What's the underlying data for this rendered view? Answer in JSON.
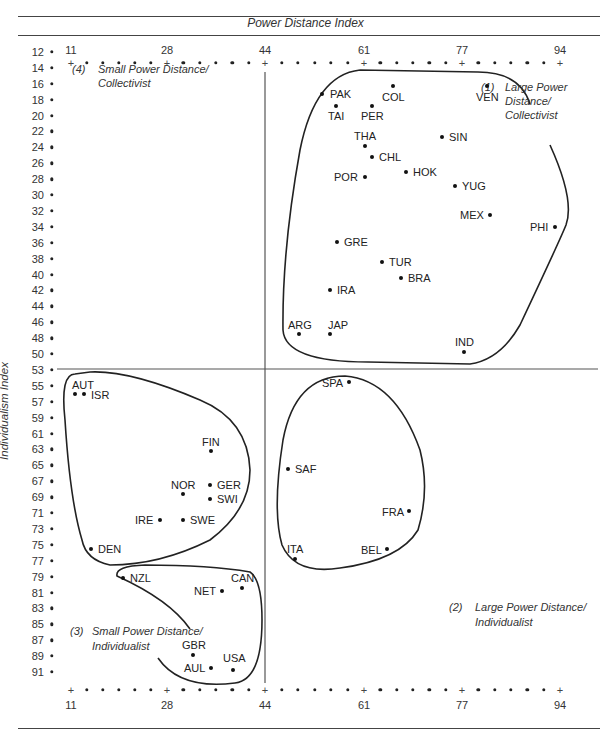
{
  "header": {
    "title": "Power Distance Index"
  },
  "y_axis_label": "Individualism Index",
  "x_ticks": [
    "11",
    "28",
    "44",
    "61",
    "77",
    "94"
  ],
  "y_ticks": [
    "12",
    "14",
    "16",
    "18",
    "20",
    "22",
    "24",
    "26",
    "28",
    "30",
    "32",
    "34",
    "36",
    "38",
    "40",
    "42",
    "44",
    "46",
    "48",
    "50",
    "53",
    "55",
    "57",
    "59",
    "61",
    "63",
    "65",
    "67",
    "69",
    "71",
    "73",
    "75",
    "77",
    "79",
    "81",
    "83",
    "85",
    "87",
    "89",
    "91"
  ],
  "quadrants": {
    "q1": {
      "num": "(1)",
      "line1": "Large Power",
      "line2": "Distance/",
      "line3": "Collectivist"
    },
    "q2": {
      "num": "(2)",
      "line1": "Large Power Distance/",
      "line2": "Individualist"
    },
    "q3": {
      "num": "(3)",
      "line1": "Small Power Distance/",
      "line2": "Individualist"
    },
    "q4": {
      "num": "(4)",
      "line1": "Small Power Distance/",
      "line2": "Collectivist"
    }
  },
  "countries": {
    "PAK": "PAK",
    "COL": "COL",
    "VEN": "VEN",
    "TAI": "TAI",
    "PER": "PER",
    "THA": "THA",
    "SIN": "SIN",
    "CHL": "CHL",
    "HOK": "HOK",
    "POR": "POR",
    "YUG": "YUG",
    "MEX": "MEX",
    "PHI": "PHI",
    "GRE": "GRE",
    "TUR": "TUR",
    "BRA": "BRA",
    "IRA": "IRA",
    "ARG": "ARG",
    "JAP": "JAP",
    "IND": "IND",
    "AUT": "AUT",
    "ISR": "ISR",
    "FIN": "FIN",
    "NOR": "NOR",
    "GER": "GER",
    "SWI": "SWI",
    "IRE": "IRE",
    "SWE": "SWE",
    "DEN": "DEN",
    "SPA": "SPA",
    "SAF": "SAF",
    "FRA": "FRA",
    "ITA": "ITA",
    "BEL": "BEL",
    "NZL": "NZL",
    "CAN": "CAN",
    "NET": "NET",
    "GBR": "GBR",
    "AUL": "AUL",
    "USA": "USA"
  },
  "chart_data": {
    "type": "scatter",
    "title": "Power Distance Index",
    "xlabel": "Power Distance Index",
    "ylabel": "Individualism Index",
    "x_ticks": [
      11,
      28,
      44,
      61,
      77,
      94
    ],
    "y_ticks": [
      12,
      14,
      16,
      18,
      20,
      22,
      24,
      26,
      28,
      30,
      32,
      34,
      36,
      38,
      40,
      42,
      44,
      46,
      48,
      50,
      53,
      55,
      57,
      59,
      61,
      63,
      65,
      67,
      69,
      71,
      73,
      75,
      77,
      79,
      81,
      83,
      85,
      87,
      89,
      91
    ],
    "xlim": [
      11,
      94
    ],
    "ylim_top_to_bottom": [
      12,
      91
    ],
    "quadrant_dividers": {
      "x": 44,
      "y": 50
    },
    "grid": false,
    "points": [
      {
        "label": "PAK",
        "x": 55,
        "y": 14
      },
      {
        "label": "COL",
        "x": 67,
        "y": 13
      },
      {
        "label": "VEN",
        "x": 81,
        "y": 12
      },
      {
        "label": "TAI",
        "x": 58,
        "y": 17
      },
      {
        "label": "PER",
        "x": 64,
        "y": 16
      },
      {
        "label": "THA",
        "x": 64,
        "y": 20
      },
      {
        "label": "SIN",
        "x": 74,
        "y": 20
      },
      {
        "label": "CHL",
        "x": 63,
        "y": 23
      },
      {
        "label": "HOK",
        "x": 68,
        "y": 25
      },
      {
        "label": "POR",
        "x": 63,
        "y": 27
      },
      {
        "label": "YUG",
        "x": 76,
        "y": 27
      },
      {
        "label": "MEX",
        "x": 81,
        "y": 30
      },
      {
        "label": "PHI",
        "x": 94,
        "y": 32
      },
      {
        "label": "GRE",
        "x": 60,
        "y": 35
      },
      {
        "label": "TUR",
        "x": 66,
        "y": 37
      },
      {
        "label": "BRA",
        "x": 69,
        "y": 38
      },
      {
        "label": "IRA",
        "x": 58,
        "y": 41
      },
      {
        "label": "ARG",
        "x": 49,
        "y": 46
      },
      {
        "label": "JAP",
        "x": 54,
        "y": 46
      },
      {
        "label": "IND",
        "x": 77,
        "y": 48
      },
      {
        "label": "AUT",
        "x": 11,
        "y": 55
      },
      {
        "label": "ISR",
        "x": 13,
        "y": 54
      },
      {
        "label": "FIN",
        "x": 33,
        "y": 63
      },
      {
        "label": "NOR",
        "x": 31,
        "y": 69
      },
      {
        "label": "GER",
        "x": 35,
        "y": 67
      },
      {
        "label": "SWI",
        "x": 34,
        "y": 68
      },
      {
        "label": "IRE",
        "x": 28,
        "y": 70
      },
      {
        "label": "SWE",
        "x": 31,
        "y": 71
      },
      {
        "label": "DEN",
        "x": 18,
        "y": 74
      },
      {
        "label": "SPA",
        "x": 57,
        "y": 51
      },
      {
        "label": "SAF",
        "x": 49,
        "y": 65
      },
      {
        "label": "FRA",
        "x": 68,
        "y": 71
      },
      {
        "label": "ITA",
        "x": 50,
        "y": 76
      },
      {
        "label": "BEL",
        "x": 65,
        "y": 75
      },
      {
        "label": "NZL",
        "x": 22,
        "y": 79
      },
      {
        "label": "CAN",
        "x": 39,
        "y": 80
      },
      {
        "label": "NET",
        "x": 38,
        "y": 80
      },
      {
        "label": "GBR",
        "x": 35,
        "y": 89
      },
      {
        "label": "AUL",
        "x": 36,
        "y": 90
      },
      {
        "label": "USA",
        "x": 40,
        "y": 91
      }
    ],
    "groups": [
      {
        "name": "(1) Large Power Distance/Collectivist",
        "members": [
          "PAK",
          "COL",
          "VEN",
          "TAI",
          "PER",
          "THA",
          "SIN",
          "CHL",
          "HOK",
          "POR",
          "YUG",
          "MEX",
          "PHI",
          "GRE",
          "TUR",
          "BRA",
          "IRA",
          "ARG",
          "JAP",
          "IND"
        ]
      },
      {
        "name": "(2) Large Power Distance/Individualist",
        "members": [
          "SPA",
          "SAF",
          "FRA",
          "ITA",
          "BEL"
        ]
      },
      {
        "name": "(3) Small Power Distance/Individualist",
        "members": [
          "NZL",
          "CAN",
          "NET",
          "GBR",
          "AUL",
          "USA"
        ]
      },
      {
        "name": "(4) Small Power Distance/Collectivist",
        "members": [
          "AUT",
          "ISR",
          "FIN",
          "NOR",
          "GER",
          "SWI",
          "IRE",
          "SWE",
          "DEN"
        ]
      }
    ]
  }
}
